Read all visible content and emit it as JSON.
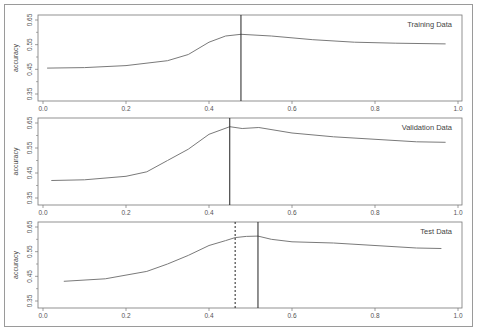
{
  "chart_data": [
    {
      "type": "line",
      "title": "Training Data",
      "xlabel": "",
      "ylabel": "accuracy",
      "xlim": [
        0.0,
        1.0
      ],
      "ylim": [
        0.33,
        0.67
      ],
      "xticks": [
        "0.0",
        "0.2",
        "0.4",
        "0.6",
        "0.8",
        "1.0"
      ],
      "yticks": [
        "0.35",
        "0.45",
        "0.55",
        "0.65"
      ],
      "grid": false,
      "legend": "none",
      "x": [
        0.01,
        0.1,
        0.2,
        0.3,
        0.35,
        0.4,
        0.44,
        0.477,
        0.55,
        0.65,
        0.75,
        0.85,
        0.97
      ],
      "series": [
        {
          "name": "accuracy",
          "values": [
            0.455,
            0.457,
            0.465,
            0.485,
            0.51,
            0.56,
            0.585,
            0.592,
            0.585,
            0.57,
            0.56,
            0.556,
            0.553
          ]
        }
      ],
      "vlines": [
        {
          "x": 0.477,
          "style": "solid"
        }
      ]
    },
    {
      "type": "line",
      "title": "Validation Data",
      "xlabel": "",
      "ylabel": "accuracy",
      "xlim": [
        0.0,
        1.0
      ],
      "ylim": [
        0.33,
        0.67
      ],
      "xticks": [
        "0.0",
        "0.2",
        "0.4",
        "0.6",
        "0.8",
        "1.0"
      ],
      "yticks": [
        "0.35",
        "0.45",
        "0.55",
        "0.65"
      ],
      "grid": false,
      "legend": "none",
      "x": [
        0.02,
        0.1,
        0.2,
        0.25,
        0.3,
        0.35,
        0.4,
        0.45,
        0.48,
        0.52,
        0.6,
        0.7,
        0.8,
        0.9,
        0.97
      ],
      "series": [
        {
          "name": "accuracy",
          "values": [
            0.42,
            0.423,
            0.437,
            0.455,
            0.5,
            0.545,
            0.605,
            0.635,
            0.628,
            0.632,
            0.61,
            0.595,
            0.585,
            0.575,
            0.573
          ]
        }
      ],
      "vlines": [
        {
          "x": 0.45,
          "style": "solid"
        }
      ]
    },
    {
      "type": "line",
      "title": "Test Data",
      "xlabel": "",
      "ylabel": "accuracy",
      "xlim": [
        0.0,
        1.0
      ],
      "ylim": [
        0.33,
        0.67
      ],
      "xticks": [
        "0.0",
        "0.2",
        "0.4",
        "0.6",
        "0.8",
        "1.0"
      ],
      "yticks": [
        "0.35",
        "0.45",
        "0.55",
        "0.65"
      ],
      "grid": false,
      "legend": "none",
      "x": [
        0.05,
        0.15,
        0.2,
        0.25,
        0.3,
        0.35,
        0.4,
        0.44,
        0.463,
        0.49,
        0.518,
        0.55,
        0.6,
        0.7,
        0.8,
        0.9,
        0.96
      ],
      "series": [
        {
          "name": "accuracy",
          "values": [
            0.43,
            0.44,
            0.455,
            0.47,
            0.5,
            0.535,
            0.575,
            0.595,
            0.607,
            0.612,
            0.613,
            0.6,
            0.59,
            0.585,
            0.575,
            0.565,
            0.563
          ]
        }
      ],
      "vlines": [
        {
          "x": 0.463,
          "style": "dashed"
        },
        {
          "x": 0.518,
          "style": "solid"
        }
      ]
    }
  ],
  "panels": [
    {
      "title": "Training Data",
      "ylabel": "accuracy"
    },
    {
      "title": "Validation Data",
      "ylabel": "accuracy"
    },
    {
      "title": "Test Data",
      "ylabel": "accuracy"
    }
  ],
  "colors": {
    "curve": "#7a7a7a",
    "vline": "#222222",
    "axis": "#777777",
    "frame": "#9a9a9a"
  }
}
